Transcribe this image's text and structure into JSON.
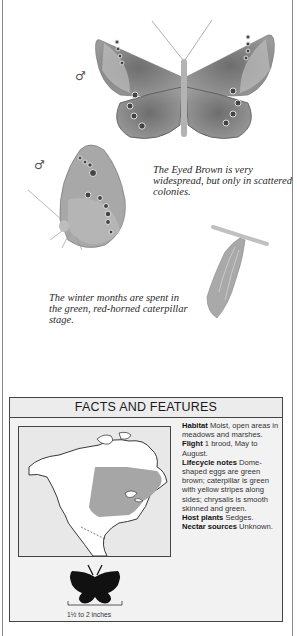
{
  "page": {
    "symbols": {
      "male_1": "♂",
      "male_2": "♂"
    },
    "captions": {
      "eyed_brown": "The Eyed Brown is very widespread, but only in scattered colonies.",
      "winter": "The winter months are spent in the green, red-horned caterpillar stage."
    },
    "illustrations": [
      {
        "name": "butterfly-upperside-male",
        "description": "Eyed Brown butterfly, open wings, male"
      },
      {
        "name": "butterfly-underside-male",
        "description": "Eyed Brown butterfly, side view underside, male"
      },
      {
        "name": "chrysalis",
        "description": "Green chrysalis hanging from twig"
      }
    ]
  },
  "facts": {
    "title": "FACTS AND FEATURES",
    "map": {
      "name": "range-map",
      "region": "North America",
      "highlight_color": "#a6a6a6"
    },
    "entries": [
      {
        "label": "Habitat",
        "text": "Moist, open areas in meadows and marshes."
      },
      {
        "label": "Flight",
        "text": "1 brood, May to August."
      },
      {
        "label": "Lifecycle notes",
        "text": "Dome-shaped eggs are green brown; caterpillar is green with yellow stripes along sides; chrysalis is smooth skinned and green."
      },
      {
        "label": "Host plants",
        "text": "Sedges."
      },
      {
        "label": "Nectar sources",
        "text": "Unknown."
      }
    ],
    "size": {
      "label": "1½ to 2 inches"
    }
  },
  "colors": {
    "box_bg": "#f2f2f2",
    "border": "#444444",
    "range_fill": "#a6a6a6"
  }
}
